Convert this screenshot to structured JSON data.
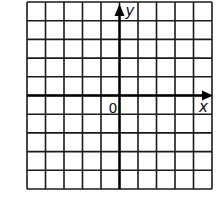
{
  "diagram": {
    "type": "coordinate-grid",
    "grid": {
      "columns": 10,
      "rows": 10,
      "left": 27,
      "top": 2,
      "right": 212,
      "bottom": 189,
      "line_color": "#1a1a1a"
    },
    "axes": {
      "origin_col": 5,
      "origin_row": 5,
      "color": "#000000",
      "x_label": "x",
      "y_label": "y",
      "origin_label": "0"
    }
  }
}
